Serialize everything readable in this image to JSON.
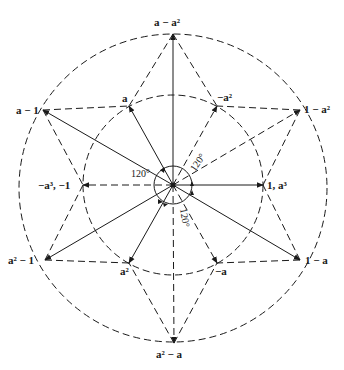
{
  "diagram": {
    "title": "",
    "center": [
      173,
      185
    ],
    "inner_circle_radius": 90,
    "outer_circle_radius": 155,
    "line_color": "#1a1a1a",
    "labels": {
      "a_minus_a2": "a − a²",
      "neg_a2": "−a²",
      "one_minus_a2": "1 − a²",
      "one_a3": "1, a³",
      "one_minus_a": "1 − a",
      "neg_a": "−a",
      "a2_minus_a": "a² − a",
      "a2": "a²",
      "a2_minus_1": "a² − 1",
      "neg_a3_neg1": "−a³, −1",
      "a_minus_1": "a − 1",
      "a": "a"
    },
    "angle_labels": [
      "120°",
      "120°",
      "120°"
    ],
    "nodes": [
      {
        "id": "a",
        "x": 129,
        "y": 106,
        "ring": "inner"
      },
      {
        "id": "neg_a2",
        "x": 217,
        "y": 106,
        "ring": "inner"
      },
      {
        "id": "one_a3",
        "x": 263,
        "y": 185,
        "ring": "inner"
      },
      {
        "id": "neg_a",
        "x": 217,
        "y": 263,
        "ring": "inner"
      },
      {
        "id": "a2",
        "x": 129,
        "y": 263,
        "ring": "inner"
      },
      {
        "id": "neg_a3_neg1",
        "x": 83,
        "y": 185,
        "ring": "inner"
      },
      {
        "id": "a_minus_a2",
        "x": 173,
        "y": 34,
        "ring": "outer"
      },
      {
        "id": "one_minus_a2",
        "x": 300,
        "y": 110,
        "ring": "outer"
      },
      {
        "id": "one_minus_a",
        "x": 300,
        "y": 260,
        "ring": "outer"
      },
      {
        "id": "a2_minus_a",
        "x": 174,
        "y": 343,
        "ring": "outer"
      },
      {
        "id": "a2_minus_1",
        "x": 45,
        "y": 260,
        "ring": "outer"
      },
      {
        "id": "a_minus_1",
        "x": 43,
        "y": 110,
        "ring": "outer"
      }
    ]
  }
}
